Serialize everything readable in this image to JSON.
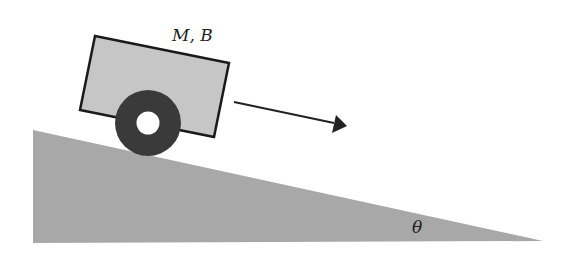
{
  "diagram": {
    "type": "physics-free-body",
    "cart": {
      "label": "M, B",
      "body_color": "#c4c4c4",
      "outline_color": "#1a1a1a",
      "wheel_color": "#3a3a3a",
      "hub_color": "#ffffff"
    },
    "incline": {
      "angle_label": "θ",
      "fill_color": "#a8a8a8"
    },
    "arrow": {
      "meaning": "direction of motion",
      "color": "#222222"
    }
  }
}
